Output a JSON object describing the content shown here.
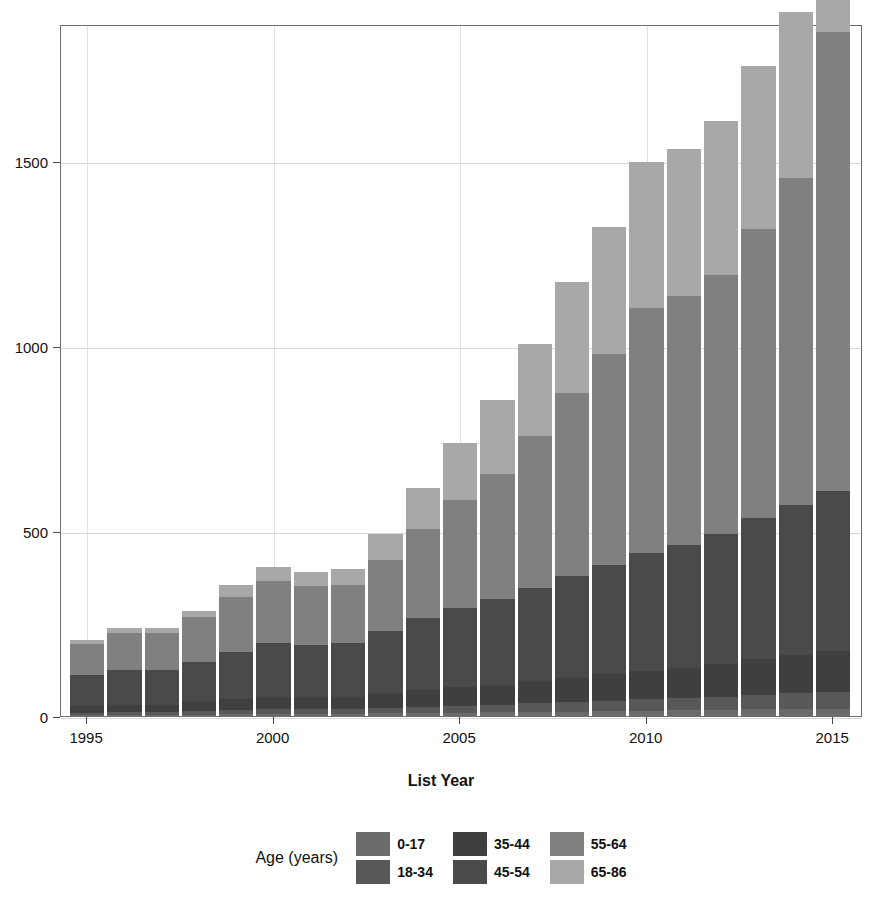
{
  "chart_data": {
    "type": "bar",
    "stacked": true,
    "title": "",
    "xlabel": "List Year",
    "ylabel": "",
    "xlim": [
      1994.3,
      2015.8
    ],
    "ylim": [
      0,
      1870
    ],
    "yticks": [
      0,
      500,
      1000,
      1500
    ],
    "ytick_labels": [
      "0",
      "500",
      "1000",
      "1500"
    ],
    "xticks": [
      1995,
      2000,
      2005,
      2010,
      2015
    ],
    "xtick_labels": [
      "1995",
      "2000",
      "2005",
      "2010",
      "2015"
    ],
    "grid": true,
    "legend_title": "Age (years)",
    "legend_position": "bottom",
    "categories": [
      "1995",
      "1996",
      "1997",
      "1998",
      "1999",
      "2000",
      "2001",
      "2002",
      "2003",
      "2004",
      "2005",
      "2006",
      "2007",
      "2008",
      "2009",
      "2010",
      "2011",
      "2012",
      "2013",
      "2014",
      "2015"
    ],
    "series": [
      {
        "name": "0-17",
        "color": "#6b6b6b",
        "values": [
          2,
          3,
          3,
          4,
          5,
          6,
          6,
          6,
          7,
          8,
          9,
          10,
          11,
          12,
          13,
          14,
          15,
          16,
          18,
          19,
          20
        ]
      },
      {
        "name": "18-34",
        "color": "#585858",
        "values": [
          6,
          7,
          7,
          9,
          11,
          13,
          13,
          13,
          15,
          17,
          19,
          21,
          23,
          26,
          28,
          31,
          33,
          36,
          40,
          43,
          46
        ]
      },
      {
        "name": "35-44",
        "color": "#3f3f3f",
        "values": [
          18,
          20,
          20,
          24,
          29,
          33,
          32,
          33,
          39,
          45,
          50,
          54,
          60,
          66,
          72,
          78,
          82,
          88,
          96,
          102,
          110
        ]
      },
      {
        "name": "45-54",
        "color": "#4a4a4a",
        "values": [
          84,
          95,
          95,
          110,
          128,
          145,
          140,
          145,
          168,
          196,
          215,
          230,
          252,
          275,
          296,
          318,
          332,
          352,
          382,
          405,
          432
        ]
      },
      {
        "name": "55-64",
        "color": "#808080",
        "values": [
          85,
          100,
          100,
          120,
          150,
          168,
          160,
          158,
          192,
          240,
          290,
          340,
          410,
          495,
          570,
          662,
          672,
          700,
          780,
          884,
          1240
        ]
      },
      {
        "name": "65-86",
        "color": "#a8a8a8",
        "values": [
          10,
          12,
          12,
          18,
          30,
          38,
          38,
          42,
          72,
          110,
          155,
          200,
          250,
          300,
          342,
          395,
          398,
          415,
          440,
          450,
          545
        ]
      }
    ],
    "totals": [
      205,
      237,
      237,
      285,
      353,
      403,
      389,
      397,
      493,
      616,
      738,
      855,
      1006,
      1174,
      1321,
      1498,
      1532,
      1607,
      1756,
      1903,
      2393
    ],
    "legend_entries": [
      {
        "label": "0-17",
        "color": "#6b6b6b"
      },
      {
        "label": "18-34",
        "color": "#585858"
      },
      {
        "label": "35-44",
        "color": "#3f3f3f"
      },
      {
        "label": "45-54",
        "color": "#4a4a4a"
      },
      {
        "label": "55-64",
        "color": "#808080"
      },
      {
        "label": "65-86",
        "color": "#a8a8a8"
      }
    ]
  }
}
